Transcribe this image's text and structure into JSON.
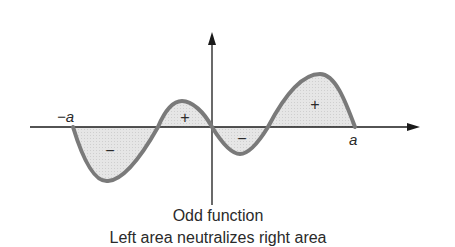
{
  "figure": {
    "caption_title": "Odd function",
    "caption_subtitle": "Left area neutralizes right area",
    "labels": {
      "neg_a": "−a",
      "pos_a": "a"
    },
    "region_signs": [
      {
        "id": "left-large-lobe",
        "sign": "−"
      },
      {
        "id": "left-small-lobe",
        "sign": "+"
      },
      {
        "id": "right-small-lobe",
        "sign": "−"
      },
      {
        "id": "right-large-lobe",
        "sign": "+"
      }
    ],
    "colors": {
      "curve": "#7a7a7a",
      "fill": "#e4e4e4",
      "axis": "#1a1a1a",
      "text": "#2a2a2a"
    }
  }
}
